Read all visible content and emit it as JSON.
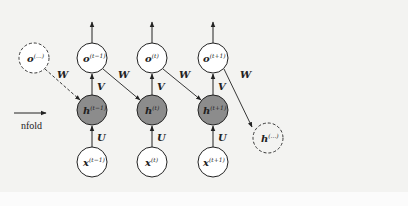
{
  "diagram": {
    "type": "unfolded recurrent neural network",
    "unfold_label": "nfold",
    "colors": {
      "background": "#f3f3f1",
      "hidden_fill": "#8c8c8c",
      "node_fill": "#ffffff",
      "stroke": "#222222"
    },
    "edge_labels": {
      "W": "W",
      "V": "V",
      "U": "U"
    },
    "columns": [
      {
        "o": "o",
        "o_sup": "(t−1)",
        "h": "h",
        "h_sup": "(t−1)",
        "x": "x",
        "x_sup": "(t−1)"
      },
      {
        "o": "o",
        "o_sup": "(t)",
        "h": "h",
        "h_sup": "(t)",
        "x": "x",
        "x_sup": "(t)"
      },
      {
        "o": "o",
        "o_sup": "(t+1)",
        "h": "h",
        "h_sup": "(t+1)",
        "x": "x",
        "x_sup": "(t+1)"
      }
    ],
    "ghost_left": {
      "label": "o",
      "sup": "(...)"
    },
    "ghost_right": {
      "label": "h",
      "sup": "(...)"
    }
  }
}
